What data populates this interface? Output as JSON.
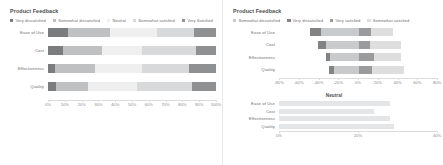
{
  "left": {
    "title": "Product Feedback",
    "legend": [
      {
        "label": "Very dissatisfied",
        "color": "#7b7c7e"
      },
      {
        "label": "Somewhat dissatisfied",
        "color": "#bfc0c2"
      },
      {
        "label": "Neutral",
        "color": "#efeff0"
      },
      {
        "label": "Somewhat satisfied",
        "color": "#d8d9da"
      },
      {
        "label": "Very Satisfied",
        "color": "#8f9092"
      }
    ],
    "axis": {
      "ticks": [
        "0%",
        "10%",
        "20%",
        "30%",
        "40%",
        "50%",
        "60%",
        "70%",
        "80%",
        "90%",
        "100%"
      ],
      "min": 0,
      "max": 100
    }
  },
  "right": {
    "title": "Product Feedback",
    "legend": [
      {
        "label": "Somewhat dissatisfied",
        "color": "#c9cacb"
      },
      {
        "label": "Very dissatisfied",
        "color": "#828385"
      },
      {
        "label": "Very satisfied",
        "color": "#9a9b9d"
      },
      {
        "label": "Somewhat satisfied",
        "color": "#dededf"
      }
    ],
    "axis": {
      "ticks": [
        "-80%",
        "-60%",
        "-40%",
        "-20%",
        "0%",
        "20%",
        "40%",
        "60%",
        "80%"
      ],
      "min": -80,
      "max": 80
    },
    "neutral": {
      "title": "Neutral",
      "axis": {
        "ticks": [
          "0%",
          "20%",
          "40%"
        ],
        "min": 0,
        "max": 40
      },
      "color": "#e4e5e6"
    }
  },
  "chart_data": [
    {
      "type": "bar",
      "title": "Product Feedback",
      "subtype": "100% stacked horizontal (Likert)",
      "xlabel": "",
      "ylabel": "",
      "xlim": [
        0,
        100
      ],
      "grid": false,
      "legend_position": "top",
      "categories": [
        "Ease of Use",
        "Cost",
        "Effectiveness",
        "Quality"
      ],
      "series": [
        {
          "name": "Very dissatisfied",
          "color": "#7b7c7e",
          "values": [
            12,
            9,
            4,
            5
          ]
        },
        {
          "name": "Somewhat dissatisfied",
          "color": "#bfc0c2",
          "values": [
            25,
            23,
            24,
            19
          ]
        },
        {
          "name": "Neutral",
          "color": "#efeff0",
          "values": [
            28,
            24,
            28,
            29
          ]
        },
        {
          "name": "Somewhat satisfied",
          "color": "#d8d9da",
          "values": [
            22,
            32,
            28,
            33
          ]
        },
        {
          "name": "Very Satisfied",
          "color": "#8f9092",
          "values": [
            13,
            12,
            16,
            14
          ]
        }
      ],
      "axis_ticks": [
        "0%",
        "10%",
        "20%",
        "30%",
        "40%",
        "50%",
        "60%",
        "70%",
        "80%",
        "90%",
        "100%"
      ]
    },
    {
      "type": "bar",
      "title": "Product Feedback",
      "subtype": "diverging stacked horizontal (Likert)",
      "xlabel": "",
      "ylabel": "",
      "xlim": [
        -80,
        80
      ],
      "grid": false,
      "legend_position": "top",
      "categories": [
        "Ease of Use",
        "Cost",
        "Effectiveness",
        "Quality"
      ],
      "series": [
        {
          "name": "Somewhat dissatisfied",
          "color": "#c9cacb",
          "values": [
            -37,
            -32,
            -28,
            -24
          ]
        },
        {
          "name": "Very dissatisfied",
          "color": "#828385",
          "values": [
            -12,
            -9,
            -4,
            -5
          ]
        },
        {
          "name": "Very satisfied",
          "color": "#9a9b9d",
          "values": [
            13,
            12,
            16,
            14
          ]
        },
        {
          "name": "Somewhat satisfied",
          "color": "#dededf",
          "values": [
            22,
            32,
            28,
            33
          ]
        }
      ],
      "axis_ticks": [
        "-80%",
        "-60%",
        "-40%",
        "-20%",
        "0%",
        "20%",
        "40%",
        "60%",
        "80%"
      ]
    },
    {
      "type": "bar",
      "title": "Neutral",
      "subtype": "horizontal bar",
      "xlabel": "",
      "ylabel": "",
      "xlim": [
        0,
        40
      ],
      "grid": false,
      "categories": [
        "Ease of Use",
        "Cost",
        "Effectiveness",
        "Quality"
      ],
      "values": [
        28,
        24,
        28,
        29
      ],
      "color": "#e4e5e6",
      "axis_ticks": [
        "0%",
        "20%",
        "40%"
      ]
    }
  ]
}
